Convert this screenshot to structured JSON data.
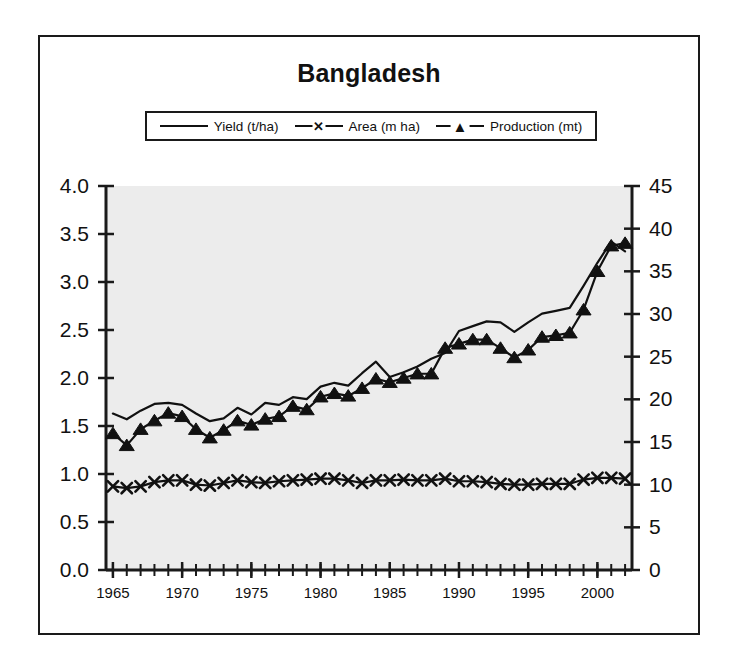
{
  "figure": {
    "title": "Bangladesh",
    "background_color": "#ffffff",
    "plot_background_color": "#ececec",
    "frame_color": "#1a1a1a",
    "series_color": "#111111"
  },
  "legend": {
    "position": "top-center",
    "entries": [
      {
        "label": "Yield (t/ha)",
        "marker": "none",
        "marker_glyph": ""
      },
      {
        "label": "Area (m ha)",
        "marker": "x",
        "marker_glyph": "✕"
      },
      {
        "label": "Production (mt)",
        "marker": "triangle",
        "marker_glyph": "▲"
      }
    ]
  },
  "chart_data": {
    "type": "line",
    "title": "Bangladesh",
    "xlabel": "",
    "ylabel": "",
    "y2label": "",
    "xlim": [
      1964.5,
      2002.5
    ],
    "ylim": [
      0.0,
      4.0
    ],
    "y2lim": [
      0,
      45
    ],
    "grid": false,
    "legend_position": "top-center",
    "x": [
      1965,
      1966,
      1967,
      1968,
      1969,
      1970,
      1971,
      1972,
      1973,
      1974,
      1975,
      1976,
      1977,
      1978,
      1979,
      1980,
      1981,
      1982,
      1983,
      1984,
      1985,
      1986,
      1987,
      1988,
      1989,
      1990,
      1991,
      1992,
      1993,
      1994,
      1995,
      1996,
      1997,
      1998,
      1999,
      2000,
      2001,
      2002
    ],
    "xticks": [
      1965,
      1970,
      1975,
      1980,
      1985,
      1990,
      1995,
      2000
    ],
    "xtick_labels": [
      "1965",
      "1970",
      "1975",
      "1980",
      "1985",
      "1990",
      "1995",
      "2000"
    ],
    "yticks": [
      0.0,
      0.5,
      1.0,
      1.5,
      2.0,
      2.5,
      3.0,
      3.5,
      4.0
    ],
    "ytick_labels": [
      "0.0",
      "0.5",
      "1.0",
      "1.5",
      "2.0",
      "2.5",
      "3.0",
      "3.5",
      "4.0"
    ],
    "y2ticks": [
      0,
      5,
      10,
      15,
      20,
      25,
      30,
      35,
      40,
      45
    ],
    "y2tick_labels": [
      "0",
      "5",
      "10",
      "15",
      "20",
      "25",
      "30",
      "35",
      "40",
      "45"
    ],
    "series": [
      {
        "name": "Yield (t/ha)",
        "axis": "left",
        "marker": "none",
        "unit": "t/ha",
        "values": [
          1.63,
          1.57,
          1.66,
          1.73,
          1.74,
          1.72,
          1.63,
          1.55,
          1.58,
          1.69,
          1.62,
          1.74,
          1.72,
          1.8,
          1.78,
          1.91,
          1.95,
          1.92,
          2.05,
          2.17,
          2.01,
          2.06,
          2.12,
          2.2,
          2.26,
          2.49,
          2.54,
          2.59,
          2.58,
          2.48,
          2.58,
          2.67,
          2.7,
          2.73,
          2.96,
          3.2,
          3.42,
          3.32
        ]
      },
      {
        "name": "Area (m ha)",
        "axis": "right",
        "marker": "x",
        "unit": "m ha",
        "values": [
          9.8,
          9.6,
          9.8,
          10.3,
          10.5,
          10.5,
          10.0,
          9.9,
          10.2,
          10.5,
          10.3,
          10.2,
          10.4,
          10.5,
          10.6,
          10.7,
          10.7,
          10.5,
          10.2,
          10.5,
          10.5,
          10.6,
          10.5,
          10.5,
          10.7,
          10.4,
          10.4,
          10.3,
          10.1,
          10.0,
          10.0,
          10.1,
          10.1,
          10.1,
          10.6,
          10.8,
          10.8,
          10.7
        ]
      },
      {
        "name": "Production (mt)",
        "axis": "right",
        "marker": "triangle",
        "unit": "mt",
        "values": [
          16.0,
          14.6,
          16.5,
          17.5,
          18.4,
          18.0,
          16.5,
          15.5,
          16.4,
          17.5,
          17.0,
          17.7,
          18.0,
          19.2,
          18.8,
          20.3,
          20.7,
          20.4,
          21.3,
          22.4,
          22.0,
          22.5,
          23.0,
          23.0,
          26.0,
          26.5,
          27.0,
          27.0,
          26.0,
          24.9,
          25.8,
          27.3,
          27.5,
          27.8,
          30.5,
          35.0,
          38.0,
          38.3
        ]
      }
    ]
  }
}
